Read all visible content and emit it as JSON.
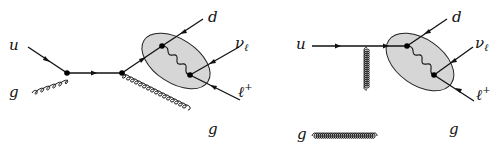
{
  "diagrams": [
    {
      "name": "s-channel",
      "labels": {
        "quark_in": "u",
        "gluon_in": "g",
        "quark_out": "d",
        "neutrino": "ν",
        "neutrino_sub": "ℓ",
        "lepton": "ℓ",
        "lepton_sup": "+",
        "gluon_out": "g"
      }
    },
    {
      "name": "t-channel",
      "labels": {
        "quark_in": "u",
        "gluon_in": "g",
        "quark_out": "d",
        "neutrino": "ν",
        "neutrino_sub": "ℓ",
        "lepton": "ℓ",
        "lepton_sup": "+",
        "gluon_out": "g"
      }
    }
  ],
  "colors": {
    "blob_fill": "#d6d6d6",
    "line": "#111111",
    "background": "#ffffff"
  }
}
